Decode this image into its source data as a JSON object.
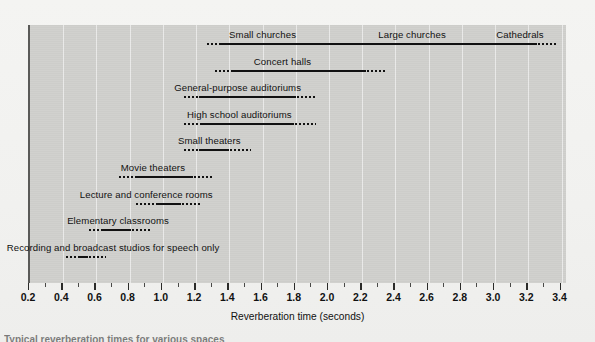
{
  "figure": {
    "x_axis_title": "Reverberation time (seconds)",
    "caption": "Typical reverberation times for various spaces"
  },
  "chart_data": {
    "type": "bar",
    "orientation": "horizontal",
    "title": "",
    "xlabel": "Reverberation time (seconds)",
    "ylabel": "",
    "xlim": [
      0.2,
      3.4
    ],
    "xticks": [
      "0.2",
      "0.4",
      "0.6",
      "0.8",
      "1.0",
      "1.2",
      "1.4",
      "1.6",
      "1.8",
      "2.0",
      "2.2",
      "2.4",
      "2.6",
      "2.8",
      "3.0",
      "3.2",
      "3.4"
    ],
    "minor_tick_step": 0.1,
    "grid": "vertical",
    "legend": "none",
    "note": "Each row is a range bar: a solid segment marks the typical range, dotted segments mark the fuzzy extensions at each end.",
    "rows": [
      {
        "labels": [
          "Small churches",
          "Large churches",
          "Cathedrals"
        ],
        "label_positions": [
          1.6,
          2.5,
          3.15
        ],
        "dot_start": 1.26,
        "solid_start": 1.35,
        "solid_end": 3.25,
        "dot_end": 3.37
      },
      {
        "labels": [
          "Concert halls"
        ],
        "label_positions": [
          1.72
        ],
        "dot_start": 1.31,
        "solid_start": 1.42,
        "solid_end": 2.22,
        "dot_end": 2.34
      },
      {
        "labels": [
          "General-purpose auditoriums"
        ],
        "label_positions": [
          1.45
        ],
        "dot_start": 1.12,
        "solid_start": 1.22,
        "solid_end": 1.8,
        "dot_end": 1.93
      },
      {
        "labels": [
          "High school auditoriums"
        ],
        "label_positions": [
          1.46
        ],
        "dot_start": 1.12,
        "solid_start": 1.23,
        "solid_end": 1.79,
        "dot_end": 1.92
      },
      {
        "labels": [
          "Small theaters"
        ],
        "label_positions": [
          1.28
        ],
        "dot_start": 1.12,
        "solid_start": 1.22,
        "solid_end": 1.4,
        "dot_end": 1.53
      },
      {
        "labels": [
          "Movie theaters"
        ],
        "label_positions": [
          0.94
        ],
        "dot_start": 0.73,
        "solid_start": 0.83,
        "solid_end": 1.18,
        "dot_end": 1.31
      },
      {
        "labels": [
          "Lecture and conference rooms"
        ],
        "label_positions": [
          0.9
        ],
        "dot_start": 0.83,
        "solid_start": 0.97,
        "solid_end": 1.11,
        "dot_end": 1.23
      },
      {
        "labels": [
          "Elementary classrooms"
        ],
        "label_positions": [
          0.73
        ],
        "dot_start": 0.55,
        "solid_start": 0.64,
        "solid_end": 0.81,
        "dot_end": 0.93
      },
      {
        "labels": [
          "Recording and broadcast studios for speech only"
        ],
        "label_positions": [
          0.7
        ],
        "dot_start": 0.41,
        "solid_start": 0.5,
        "solid_end": 0.55,
        "dot_end": 0.66
      }
    ]
  }
}
